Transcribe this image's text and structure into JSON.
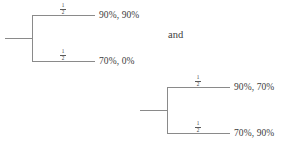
{
  "figure": {
    "conjunction": "and",
    "trees": [
      {
        "id": "tree-left",
        "branches": [
          {
            "probability_numerator": "1",
            "probability_denominator": "2",
            "payoff": "90%, 90%"
          },
          {
            "probability_numerator": "1",
            "probability_denominator": "2",
            "payoff": "70%, 0%"
          }
        ]
      },
      {
        "id": "tree-right",
        "branches": [
          {
            "probability_numerator": "1",
            "probability_denominator": "2",
            "payoff": "90%, 70%"
          },
          {
            "probability_numerator": "1",
            "probability_denominator": "2",
            "payoff": "70%, 90%"
          }
        ]
      }
    ]
  },
  "colors": {
    "line": "#8a8a8a",
    "text": "#3d3d3d",
    "background": "#ffffff"
  }
}
